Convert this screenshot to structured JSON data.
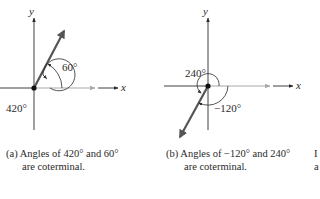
{
  "figures": [
    {
      "id": "a",
      "x_label": "x",
      "y_label": "y",
      "angle_labels": [
        "60°",
        "420°"
      ],
      "angles_deg": [
        60,
        420
      ],
      "caption_tag": "(a)",
      "caption_line1": "Angles of 420° and 60°",
      "caption_line2": "are coterminal."
    },
    {
      "id": "b",
      "x_label": "x",
      "y_label": "y",
      "angle_labels": [
        "240°",
        "−120°"
      ],
      "angles_deg": [
        240,
        -120
      ],
      "caption_tag": "(b)",
      "caption_line1": "Angles of −120° and 240°",
      "caption_line2": "are coterminal."
    }
  ],
  "partial_caption": {
    "line1": "I",
    "line2": "a"
  },
  "colors": {
    "axis": "#2a2a2a",
    "initial_side": "#a9a9a9",
    "terminal_side": "#555555"
  }
}
